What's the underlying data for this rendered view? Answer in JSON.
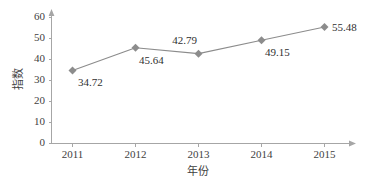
{
  "chart_data": {
    "type": "line",
    "title": "",
    "xlabel": "年份",
    "ylabel": "指数",
    "categories": [
      "2011",
      "2012",
      "2013",
      "2014",
      "2015"
    ],
    "values": [
      34.72,
      45.64,
      42.79,
      49.15,
      55.48
    ],
    "series": [
      {
        "name": "指数",
        "values": [
          34.72,
          45.64,
          42.79,
          49.15,
          55.48
        ]
      }
    ],
    "point_labels": [
      "34.72",
      "45.64",
      "42.79",
      "49.15",
      "55.48"
    ],
    "ylim": [
      0,
      60
    ],
    "yticks": [
      "0",
      "10",
      "20",
      "30",
      "40",
      "50",
      "60"
    ],
    "xticks": [
      "2011",
      "2012",
      "2013",
      "2014",
      "2015"
    ],
    "grid": false,
    "legend": false,
    "legend_position": "none",
    "colors": {
      "line": "#8c8c8c",
      "marker": "#8c8c8c",
      "axis": "#a6a6a6",
      "text": "#3f3f3f",
      "background": "#ffffff"
    },
    "marker_shape": "diamond",
    "axis_arrows": true
  }
}
